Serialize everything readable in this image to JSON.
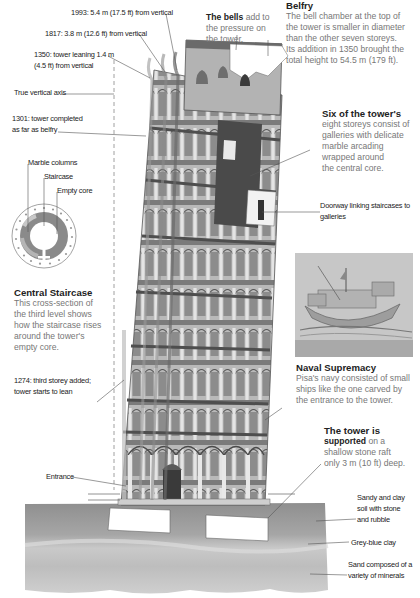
{
  "diagram": {
    "colors": {
      "background": "#ffffff",
      "heading_text": "#222222",
      "body_text": "#777777",
      "leader_lines": "#555555",
      "stone": "#b8b8b8",
      "soil": "#a9a9a9"
    }
  },
  "timeline_labels": {
    "y1993": "1993: 5.4 m (17.5 ft) from vertical",
    "y1817": "1817: 3.8 m (12.6 ft) from vertical",
    "y1350_line1": "1350: tower leaning 1.4 m",
    "y1350_line2": "(4.5 ft) from vertical",
    "true_vertical": "True vertical axis",
    "y1301_line1": "1301: tower completed",
    "y1301_line2": "as far as belfry",
    "y1274_line1": "1274: third storey added;",
    "y1274_line2": "tower starts to lean",
    "entrance": "Entrance"
  },
  "cross_section": {
    "labels": {
      "marble_columns": "Marble columns",
      "staircase": "Staircase",
      "empty_core": "Empty core"
    },
    "heading": "Central Staircase",
    "body": [
      "This cross-section of",
      "the third level shows",
      "how the staircase rises",
      "around the tower's",
      "empty core."
    ]
  },
  "bells": {
    "bold": "The bells",
    "lines": [
      " add to",
      "the pressure on",
      "the tower."
    ]
  },
  "belfry": {
    "heading": "Belfry",
    "body": [
      "The bell chamber at the top of",
      "the tower is smaller in diameter",
      "than the other seven storeys.",
      "Its addition in 1350 brought the",
      "total height to 54.5 m (179 ft)."
    ]
  },
  "storeys": {
    "heading": "Six of the tower's",
    "body": [
      "eight storeys consist of",
      "galleries with delicate",
      "marble arcading",
      "wrapped around",
      "the central core."
    ]
  },
  "doorway": {
    "line1": "Doorway linking staircases to",
    "line2": "galleries"
  },
  "naval": {
    "heading": "Naval Supremacy",
    "body": [
      "Pisa's navy consisted of small",
      "ships like the one carved by",
      "the entrance to the tower."
    ]
  },
  "foundation": {
    "bold_line1": "The tower is",
    "bold_line2": "supported",
    "line2_rest": " on a",
    "body": [
      "shallow stone raft",
      "only 3 m (10 ft) deep."
    ]
  },
  "soil_layers": {
    "layer1": [
      "Sandy and clay",
      "soil with stone",
      "and rubble"
    ],
    "layer2": "Grey-blue clay",
    "layer3": [
      "Sand composed of a",
      "variety of minerals"
    ]
  }
}
